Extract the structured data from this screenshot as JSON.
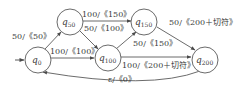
{
  "diagram": {
    "type": "state-transition-diagram",
    "colors": {
      "stroke": "#5a5a5a",
      "text": "#3a3a3a",
      "background": "#ffffff"
    },
    "start_state": "q0",
    "nodes": [
      {
        "id": "q0",
        "base": "q",
        "sub": "0"
      },
      {
        "id": "q50",
        "base": "q",
        "sub": "50"
      },
      {
        "id": "q100",
        "base": "q",
        "sub": "100"
      },
      {
        "id": "q150",
        "base": "q",
        "sub": "150"
      },
      {
        "id": "q200",
        "base": "q",
        "sub": "200"
      }
    ],
    "edges": [
      {
        "from": "q0",
        "to": "q50",
        "label": "50/《50》"
      },
      {
        "from": "q0",
        "to": "q100",
        "label": "100/《100》"
      },
      {
        "from": "q50",
        "to": "q150",
        "label": "100/《150》"
      },
      {
        "from": "q50",
        "to": "q100",
        "label": "50/《100》"
      },
      {
        "from": "q100",
        "to": "q150",
        "label": "50/《150》"
      },
      {
        "from": "q100",
        "to": "q200",
        "label": "100/《200＋切符》"
      },
      {
        "from": "q150",
        "to": "q200",
        "label": "50/《200＋切符》"
      },
      {
        "from": "q200",
        "to": "q0",
        "label": "ε/《0》"
      }
    ]
  }
}
